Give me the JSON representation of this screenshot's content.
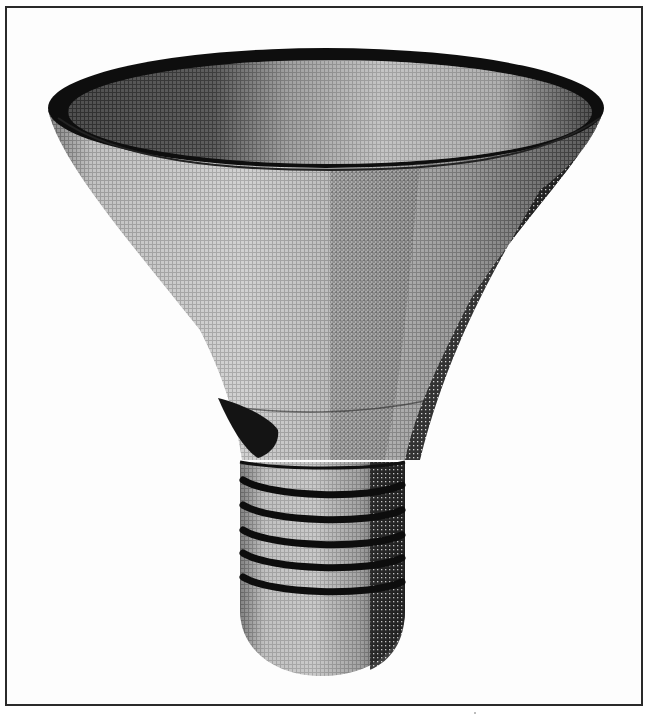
{
  "figure": {
    "rendering": "dithered halftone 3D shaded object",
    "colors": {
      "background": "#ffffff",
      "frame": "#2a2a2a",
      "dark": "#141414",
      "mid": "#7a7a7a",
      "light": "#c9c9c9"
    },
    "thread_count": 5
  }
}
